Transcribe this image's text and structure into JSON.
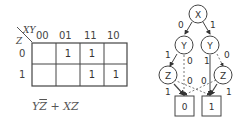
{
  "kmap": {
    "row_var": "Z",
    "col_var": "XY",
    "col_headers": [
      "00",
      "01",
      "11",
      "10"
    ],
    "row_headers": [
      "0",
      "1"
    ],
    "cells": [
      [
        "",
        "1",
        "1",
        ""
      ],
      [
        "",
        "",
        "1",
        "1"
      ]
    ]
  },
  "expression": {
    "term1_a": "Y",
    "term1_b": "Z",
    "plus": " + ",
    "term2": "XZ"
  },
  "bdd": {
    "nodes": {
      "x": "X",
      "y_left": "Y",
      "y_right": "Y",
      "z_left": "Z",
      "z_right": "Z",
      "t0": "0",
      "t1": "1"
    },
    "edge_labels": {
      "x_to_yl": "0",
      "x_to_yr": "1",
      "yl_to_zl": "1",
      "yl_to_t0": "0",
      "yr_to_t1": "1",
      "yr_to_zr": "0",
      "zl_to_t1": "0",
      "zl_to_t0": "1",
      "zr_to_t0": "0",
      "zr_to_t1": "1"
    }
  }
}
